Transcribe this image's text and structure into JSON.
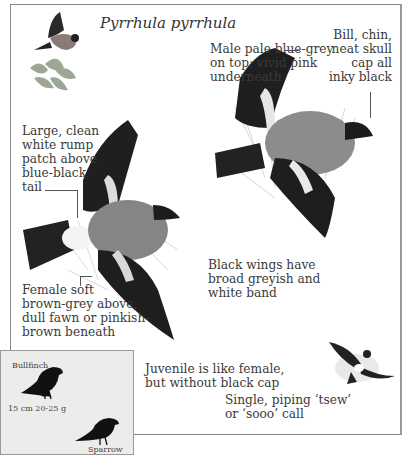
{
  "page": {
    "species_title": "Pyrrhula pyrrhula",
    "annotations": {
      "male_colour": [
        "Male pale blue-grey",
        "on top; vivid pink",
        "underneath"
      ],
      "bill_cap": [
        "Bill, chin,",
        "neat skull",
        "cap all",
        "inky black"
      ],
      "rump_patch": [
        "Large, clean",
        "white rump",
        "patch above",
        "blue-black",
        "tail"
      ],
      "female_colour": [
        "Female soft",
        "brown-grey above,",
        "dull fawn or pinkish-",
        "brown beneath"
      ],
      "wings": [
        "Black wings have",
        "broad greyish and",
        "white band"
      ],
      "juvenile": [
        "Juvenile is like female,",
        "but without black cap"
      ],
      "call": [
        "Single, piping ‘tsew’",
        "or ‘sooo’ call"
      ]
    },
    "size_comparison": {
      "bird_label": "Bullfinch",
      "measurements": "15 cm  20-25 g",
      "reference_label": "Sparrow"
    },
    "illustrations": [
      {
        "name": "thumbnail-bird-in-flight",
        "description": "small flying bullfinch over plant"
      },
      {
        "name": "male-bullfinch-flight",
        "description": "male bullfinch in flight, right"
      },
      {
        "name": "female-bullfinch-flight",
        "description": "female bullfinch in flight, left"
      },
      {
        "name": "bullfinch-silhouette-flight",
        "description": "small bird in flight, bottom right"
      }
    ],
    "colors": {
      "text": "#3a3a3a",
      "frame": "#8a8a8a",
      "inset_bg": "#ececeb",
      "wing_black": "#1e1e1e",
      "body_grey": "#8c8c8c"
    }
  }
}
